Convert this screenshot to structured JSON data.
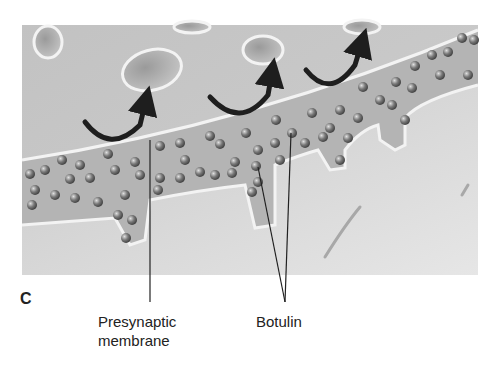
{
  "figure": {
    "panel_label": "C",
    "labels": {
      "presynaptic_line1": "Presynaptic",
      "presynaptic_line2": "membrane",
      "botulin": "Botulin"
    },
    "colors": {
      "background": "#ffffff",
      "cleft_fill": "#b9b9b9",
      "top_area": "#c6c6c6",
      "bottom_area": "#d8d8d8",
      "membrane_edge": "#f2f2f2",
      "particle": "#6f6f6f",
      "arrow": "#1e1e1e"
    },
    "arrows_count": 3
  }
}
